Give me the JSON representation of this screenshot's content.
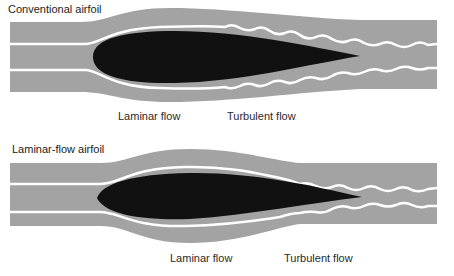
{
  "diagrams": [
    {
      "title": "Conventional airfoil",
      "labels": {
        "laminar": "Laminar flow",
        "turbulent": "Turbulent flow"
      }
    },
    {
      "title": "Laminar-flow airfoil",
      "labels": {
        "laminar": "Laminar flow",
        "turbulent": "Turbulent flow"
      }
    }
  ],
  "colors": {
    "band": "#a3a3a3",
    "airfoil": "#111111",
    "streamline": "#ffffff",
    "text": "#222222"
  }
}
